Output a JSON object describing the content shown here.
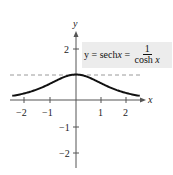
{
  "chart_data": {
    "type": "line",
    "title": "",
    "xlabel": "x",
    "ylabel": "y",
    "xlim": [
      -2.5,
      2.5
    ],
    "ylim": [
      -2.6,
      2.8
    ],
    "x_ticks": [
      -2,
      -1,
      1,
      2
    ],
    "y_ticks": [
      -2,
      -1,
      2
    ],
    "x_tick_labels": [
      "−2",
      "−1",
      "1",
      "2"
    ],
    "y_tick_labels": [
      "−2",
      "−1",
      "2"
    ],
    "grid": false,
    "asymptote": {
      "y": 1,
      "style": "dashed"
    },
    "series": [
      {
        "name": "y = sech x = 1/cosh x",
        "x": [
          -2.5,
          -2,
          -1.5,
          -1,
          -0.5,
          0,
          0.5,
          1,
          1.5,
          2,
          2.5
        ],
        "y": [
          0.163,
          0.266,
          0.425,
          0.648,
          0.887,
          1.0,
          0.887,
          0.648,
          0.425,
          0.266,
          0.163
        ]
      }
    ],
    "annotation": {
      "lhs": "y = sech ",
      "var": "x",
      "mid": " = ",
      "numerator": "1",
      "denominator_text": "cosh ",
      "denominator_var": "x"
    }
  }
}
